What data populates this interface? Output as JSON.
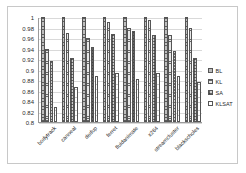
{
  "chart_data": {
    "type": "bar",
    "title": "",
    "xlabel": "",
    "ylabel": "",
    "ylim": [
      0.8,
      1.0
    ],
    "ytick_labels": [
      "1",
      "0.98",
      "0.96",
      "0.94",
      "0.92",
      "0.9",
      "0.88",
      "0.86",
      "0.84",
      "0.82",
      "0.8"
    ],
    "ytick_values": [
      1.0,
      0.98,
      0.96,
      0.94,
      0.92,
      0.9,
      0.88,
      0.86,
      0.84,
      0.82,
      0.8
    ],
    "grid": true,
    "legend_position": "right",
    "categories": [
      "bodytrack",
      "canneal",
      "dedup",
      "ferret",
      "fluidanimate",
      "x264",
      "streamcluster",
      "blackscholes"
    ],
    "series": [
      {
        "name": "BL",
        "values": [
          1.0,
          1.0,
          1.0,
          1.0,
          1.0,
          1.0,
          1.0,
          1.0
        ]
      },
      {
        "name": "KL",
        "values": [
          0.94,
          0.97,
          0.96,
          0.99,
          0.98,
          0.995,
          0.965,
          0.98
        ]
      },
      {
        "name": "SA",
        "values": [
          0.917,
          0.921,
          0.943,
          0.967,
          0.973,
          0.965,
          0.935,
          0.921
        ]
      },
      {
        "name": "KLSAT",
        "values": [
          0.829,
          0.866,
          0.888,
          0.893,
          0.881,
          0.894,
          0.888,
          0.877
        ]
      }
    ]
  },
  "legend": {
    "items": [
      {
        "label": "BL"
      },
      {
        "label": "KL"
      },
      {
        "label": "SA"
      },
      {
        "label": "KLSAT"
      }
    ]
  }
}
